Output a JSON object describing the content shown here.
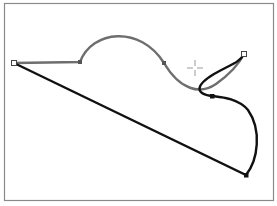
{
  "canvas": {
    "frame": {
      "x": 4,
      "y": 3,
      "w": 270,
      "h": 197,
      "stroke": "#8a8a8a"
    },
    "colors": {
      "gray_path": "#6e6e6e",
      "black_path": "#111111",
      "crosshair": "#9a9a9a"
    },
    "anchors": [
      {
        "name": "start-anchor",
        "x": 14,
        "y": 63,
        "type": "open-square"
      },
      {
        "name": "gray-anchor-1",
        "x": 80,
        "y": 62,
        "type": "filled"
      },
      {
        "name": "gray-anchor-2",
        "x": 164,
        "y": 63,
        "type": "filled"
      },
      {
        "name": "end-anchor",
        "x": 244,
        "y": 54,
        "type": "open-square"
      },
      {
        "name": "black-anchor-1",
        "x": 212,
        "y": 96,
        "type": "filled"
      },
      {
        "name": "black-anchor-2",
        "x": 246,
        "y": 175,
        "type": "filled"
      }
    ],
    "crosshair": {
      "x": 195,
      "y": 68
    }
  }
}
